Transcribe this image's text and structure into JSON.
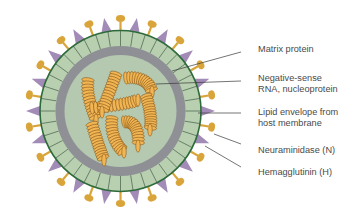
{
  "diagram": {
    "colors": {
      "background": "#ffffff",
      "outer_band": "#b8cfb0",
      "outer_rim": "#2e6b3a",
      "matrix_ring": "#8f9096",
      "inner_core": "#b4c9b0",
      "rna_fill": "#f1b553",
      "rna_stroke": "#8a5a1c",
      "hemagglutinin": "#d9a53a",
      "neuraminidase": "#a28bb7",
      "leader_line": "#3a3a3a",
      "label_text": "#4a4a4a"
    },
    "labels": [
      {
        "id": "matrix-protein",
        "lines": [
          "Matrix protein"
        ]
      },
      {
        "id": "rna-nucleoprotein",
        "lines": [
          "Negative-sense",
          "RNA, nucleoprotein"
        ]
      },
      {
        "id": "lipid-envelope",
        "lines": [
          "Lipid envelope from",
          "host membrane"
        ]
      },
      {
        "id": "neuraminidase",
        "lines": [
          "Neuraminidase (N)"
        ]
      },
      {
        "id": "hemagglutinin",
        "lines": [
          "Hemagglutinin (H)"
        ]
      }
    ]
  }
}
